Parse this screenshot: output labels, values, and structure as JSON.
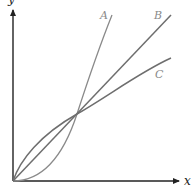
{
  "diagram": {
    "axes": {
      "x_label": "x",
      "y_label": "y"
    },
    "curves": [
      {
        "id": "A",
        "label": "A",
        "shape": "convex (grows faster), passes below line near origin",
        "color": "#8a8a8a"
      },
      {
        "id": "B",
        "label": "B",
        "shape": "straight line through origin",
        "color": "#6e6e6e"
      },
      {
        "id": "C",
        "label": "C",
        "shape": "concave (grows slower), passes above line near origin",
        "color": "#6e6e6e"
      }
    ],
    "intersection_note": "All three curves meet at the origin and at one common point"
  }
}
